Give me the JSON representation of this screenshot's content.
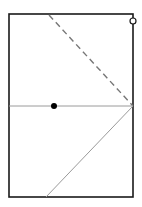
{
  "diagram": {
    "type": "geometry-fold",
    "rectangle": {
      "x1": 9,
      "y1": 14,
      "x2": 133,
      "y2": 197,
      "stroke": "#1a1a1a",
      "stroke_width": 1.6
    },
    "lines": [
      {
        "name": "fold-dashed-line",
        "x1": 49,
        "y1": 15,
        "x2": 133,
        "y2": 106,
        "stroke": "#777777",
        "dashed": true
      },
      {
        "name": "horizontal-midline",
        "x1": 9,
        "y1": 106,
        "x2": 133,
        "y2": 106,
        "stroke": "#9a9a9a",
        "dashed": false
      },
      {
        "name": "diagonal-line",
        "x1": 46,
        "y1": 197,
        "x2": 133,
        "y2": 106,
        "stroke": "#9a9a9a",
        "dashed": false
      }
    ],
    "points": [
      {
        "name": "filled-point",
        "cx": 54,
        "cy": 106,
        "r": 3,
        "fill": "#000000",
        "open": false
      },
      {
        "name": "open-point",
        "cx": 133,
        "cy": 21,
        "r": 3,
        "fill": "none",
        "open": true
      }
    ]
  }
}
